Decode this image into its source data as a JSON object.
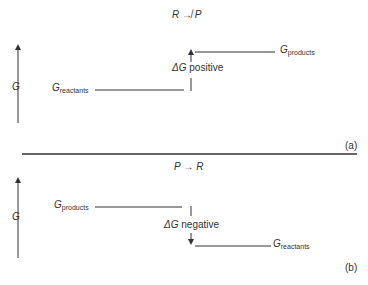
{
  "panel_a": {
    "reaction": {
      "left": "R",
      "arrow": "↛",
      "right": "P"
    },
    "axis_label": "G",
    "start_level": {
      "symbol": "G",
      "subscript": "reactants"
    },
    "end_level": {
      "symbol": "G",
      "subscript": "products"
    },
    "delta": {
      "symbol": "ΔG",
      "text": "positive"
    },
    "panel_label": "(a)"
  },
  "panel_b": {
    "reaction": {
      "left": "P",
      "arrow": "→",
      "right": "R"
    },
    "axis_label": "G",
    "start_level": {
      "symbol": "G",
      "subscript": "products"
    },
    "end_level": {
      "symbol": "G",
      "subscript": "reactants"
    },
    "delta": {
      "symbol": "ΔG",
      "text": "negative"
    },
    "panel_label": "(b)"
  },
  "colors": {
    "ink": "#333333",
    "background": "#ffffff"
  }
}
